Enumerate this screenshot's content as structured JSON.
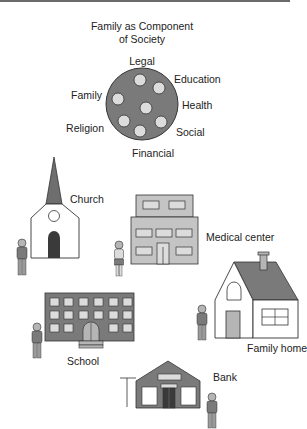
{
  "title": {
    "line1": "Family as Component",
    "line2": "of Society"
  },
  "society_circle": {
    "labels": {
      "legal": "Legal",
      "education": "Education",
      "family": "Family",
      "health": "Health",
      "religion": "Religion",
      "social": "Social",
      "financial": "Financial"
    },
    "component_count": 7
  },
  "buildings": {
    "church": "Church",
    "medical_center": "Medical center",
    "school": "School",
    "family_home": "Family home",
    "bank": "Bank"
  },
  "colors": {
    "fill_dark": "#7a7a7a",
    "fill_mid": "#b5b5b5",
    "fill_light": "#dcdcdc",
    "stroke": "#333333",
    "door": "#3a3a3a"
  }
}
